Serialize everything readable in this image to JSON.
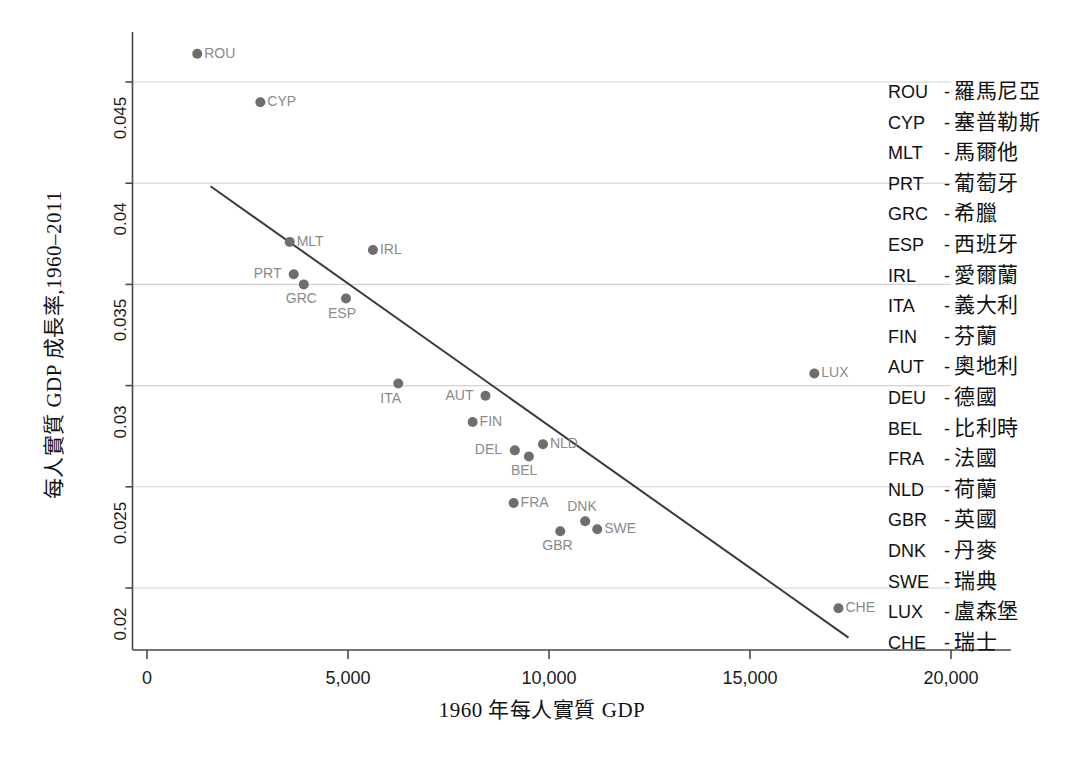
{
  "chart_data": {
    "type": "scatter",
    "title": "",
    "xlabel": "1960 年每人實質 GDP",
    "ylabel": "每人實質 GDP 成長率,1960–2011",
    "xlim": [
      0,
      20000
    ],
    "ylim": [
      0.0175,
      0.0475
    ],
    "grid": true,
    "legend_position": "right",
    "xticks": [
      "0",
      "5,000",
      "10,000",
      "15,000",
      "20,000"
    ],
    "xtick_values": [
      0,
      5000,
      10000,
      15000,
      20000
    ],
    "yticks": [
      "0.02",
      "0.025",
      "0.03",
      "0.035",
      "0.04",
      "0.045"
    ],
    "ytick_values": [
      0.02,
      0.025,
      0.03,
      0.035,
      0.04,
      0.045
    ],
    "point_color": "#6e6e6e",
    "label_color": "#8a8a8a",
    "line_color": "#3a3a3a",
    "points": [
      {
        "code": "ROU",
        "x": 1250,
        "y": 0.0464,
        "label_pos": "right"
      },
      {
        "code": "CYP",
        "x": 2820,
        "y": 0.044,
        "label_pos": "right"
      },
      {
        "code": "MLT",
        "x": 3550,
        "y": 0.0371,
        "label_pos": "right"
      },
      {
        "code": "PRT",
        "x": 3650,
        "y": 0.0355,
        "label_pos": "left"
      },
      {
        "code": "GRC",
        "x": 3900,
        "y": 0.035,
        "label_pos": "below"
      },
      {
        "code": "ESP",
        "x": 4950,
        "y": 0.0343,
        "label_pos": "below"
      },
      {
        "code": "IRL",
        "x": 5620,
        "y": 0.0367,
        "label_pos": "right"
      },
      {
        "code": "ITA",
        "x": 6250,
        "y": 0.0301,
        "label_pos": "below"
      },
      {
        "code": "AUT",
        "x": 8420,
        "y": 0.0295,
        "label_pos": "left"
      },
      {
        "code": "FIN",
        "x": 8100,
        "y": 0.0282,
        "label_pos": "right"
      },
      {
        "code": "DEL",
        "x": 9150,
        "y": 0.0268,
        "label_pos": "left"
      },
      {
        "code": "BEL",
        "x": 9500,
        "y": 0.0265,
        "label_pos": "below"
      },
      {
        "code": "NLD",
        "x": 9850,
        "y": 0.0271,
        "label_pos": "right"
      },
      {
        "code": "FRA",
        "x": 9120,
        "y": 0.0242,
        "label_pos": "right"
      },
      {
        "code": "GBR",
        "x": 10280,
        "y": 0.0228,
        "label_pos": "below"
      },
      {
        "code": "DNK",
        "x": 10900,
        "y": 0.0233,
        "label_pos": "above"
      },
      {
        "code": "SWE",
        "x": 11200,
        "y": 0.0229,
        "label_pos": "right"
      },
      {
        "code": "LUX",
        "x": 16600,
        "y": 0.0306,
        "label_pos": "right"
      },
      {
        "code": "CHE",
        "x": 17200,
        "y": 0.019,
        "label_pos": "right"
      }
    ],
    "trend_line": {
      "x_start": 1580,
      "y_start": 0.03985,
      "x_end": 17450,
      "y_end": 0.01755
    }
  },
  "legend": {
    "separator": "-",
    "entries": [
      {
        "code": "ROU",
        "name": "羅馬尼亞"
      },
      {
        "code": "CYP",
        "name": "塞普勒斯"
      },
      {
        "code": "MLT",
        "name": "馬爾他"
      },
      {
        "code": "PRT",
        "name": "葡萄牙"
      },
      {
        "code": "GRC",
        "name": "希臘"
      },
      {
        "code": "ESP",
        "name": "西班牙"
      },
      {
        "code": "IRL",
        "name": "愛爾蘭"
      },
      {
        "code": "ITA",
        "name": "義大利"
      },
      {
        "code": "FIN",
        "name": "芬蘭"
      },
      {
        "code": "AUT",
        "name": "奧地利"
      },
      {
        "code": "DEU",
        "name": "德國"
      },
      {
        "code": "BEL",
        "name": "比利時"
      },
      {
        "code": "FRA",
        "name": "法國"
      },
      {
        "code": "NLD",
        "name": "荷蘭"
      },
      {
        "code": "GBR",
        "name": "英國"
      },
      {
        "code": "DNK",
        "name": "丹麥"
      },
      {
        "code": "SWE",
        "name": "瑞典"
      },
      {
        "code": "LUX",
        "name": "盧森堡"
      },
      {
        "code": "CHE",
        "name": "瑞士"
      }
    ]
  }
}
